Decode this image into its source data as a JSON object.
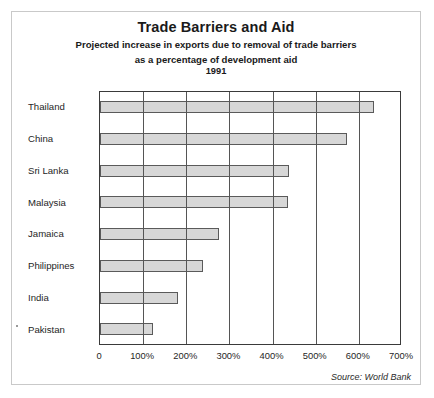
{
  "chart_data": {
    "type": "bar",
    "orientation": "horizontal",
    "title": "Trade Barriers and Aid",
    "subtitle_line1": "Projected increase in exports due to removal of trade barriers",
    "subtitle_line2": "as a percentage of development  aid",
    "year": "1991",
    "categories": [
      "Thailand",
      "China",
      "Sri Lanka",
      "Malaysia",
      "Jamaica",
      "Philippines",
      "India",
      "Pakistan"
    ],
    "values": [
      635,
      573,
      437,
      435,
      275,
      239,
      181,
      123
    ],
    "xlabel": "",
    "ylabel": "",
    "xlim": [
      0,
      700
    ],
    "xticks": [
      0,
      100,
      200,
      300,
      400,
      500,
      600,
      700
    ],
    "xtick_labels": [
      "0",
      "100%",
      "200%",
      "300%",
      "400%",
      "500%",
      "600%",
      "700%"
    ],
    "grid": "vertical",
    "legend": "none",
    "source": "Source: World Bank",
    "bar_fill": "#d7d7d7",
    "bar_border": "#5a5a5a",
    "axis_color": "#3a3a3a",
    "grid_color": "#555555"
  }
}
